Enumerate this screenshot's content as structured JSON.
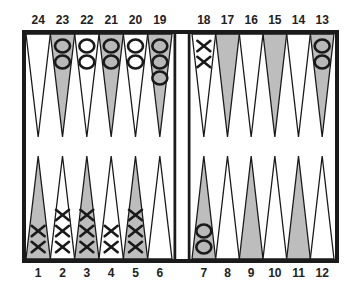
{
  "colors": {
    "frame": "#1a1a1a",
    "dark_point": "#bdbdbd",
    "light_point": "#ffffff",
    "checker_o_fill": "#b8b8b8",
    "checker_o_fill_light": "#ffffff",
    "checker_stroke": "#1a1a1a",
    "x_mark": "#1a1a1a"
  },
  "top_labels": [
    "24",
    "23",
    "22",
    "21",
    "20",
    "19",
    "18",
    "17",
    "16",
    "15",
    "14",
    "13"
  ],
  "bottom_labels": [
    "1",
    "2",
    "3",
    "4",
    "5",
    "6",
    "7",
    "8",
    "9",
    "10",
    "11",
    "12"
  ],
  "points": [
    {
      "n": 1,
      "shade": "dark",
      "checkers": "X",
      "count": 2
    },
    {
      "n": 2,
      "shade": "light",
      "checkers": "X",
      "count": 3
    },
    {
      "n": 3,
      "shade": "dark",
      "checkers": "X",
      "count": 3
    },
    {
      "n": 4,
      "shade": "light",
      "checkers": "X",
      "count": 2
    },
    {
      "n": 5,
      "shade": "dark",
      "checkers": "X",
      "count": 3
    },
    {
      "n": 6,
      "shade": "light",
      "checkers": "",
      "count": 0
    },
    {
      "n": 7,
      "shade": "dark",
      "checkers": "O",
      "count": 2
    },
    {
      "n": 8,
      "shade": "light",
      "checkers": "",
      "count": 0
    },
    {
      "n": 9,
      "shade": "dark",
      "checkers": "",
      "count": 0
    },
    {
      "n": 10,
      "shade": "light",
      "checkers": "",
      "count": 0
    },
    {
      "n": 11,
      "shade": "dark",
      "checkers": "",
      "count": 0
    },
    {
      "n": 12,
      "shade": "light",
      "checkers": "",
      "count": 0
    },
    {
      "n": 13,
      "shade": "dark",
      "checkers": "O",
      "count": 2
    },
    {
      "n": 14,
      "shade": "light",
      "checkers": "",
      "count": 0
    },
    {
      "n": 15,
      "shade": "dark",
      "checkers": "",
      "count": 0
    },
    {
      "n": 16,
      "shade": "light",
      "checkers": "",
      "count": 0
    },
    {
      "n": 17,
      "shade": "dark",
      "checkers": "",
      "count": 0
    },
    {
      "n": 18,
      "shade": "light",
      "checkers": "X",
      "count": 2
    },
    {
      "n": 19,
      "shade": "dark",
      "checkers": "O",
      "count": 3
    },
    {
      "n": 20,
      "shade": "light",
      "checkers": "O",
      "count": 2
    },
    {
      "n": 21,
      "shade": "dark",
      "checkers": "O",
      "count": 2
    },
    {
      "n": 22,
      "shade": "light",
      "checkers": "O",
      "count": 2
    },
    {
      "n": 23,
      "shade": "dark",
      "checkers": "O",
      "count": 2
    },
    {
      "n": 24,
      "shade": "light",
      "checkers": "",
      "count": 0
    }
  ]
}
